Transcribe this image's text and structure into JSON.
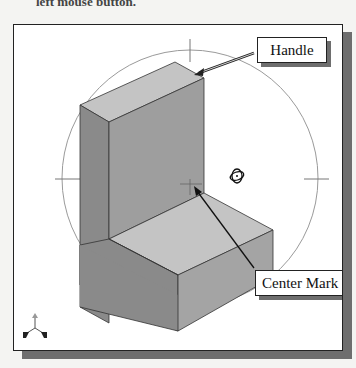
{
  "page": {
    "top_partial_text": "left mouse button.",
    "ghost_lines": [
      "by the triad, ... rotated with the ...",
      "...from the screen ... to ... with the",
      "...completely ... to any ... the",
      "option.",
      "...Rotate ... with the ...",
      "...Center ... to ... the ...",
      "...the ... the",
      "4.  Hit the function key [F6] once",
      "    automatically adjusted; display",
      "    and also to fit the display to the",
      "    ...adjusted view."
    ]
  },
  "figure": {
    "type": "3D free-orbit rotation viewport",
    "callouts": {
      "handle": "Handle",
      "center_mark": "Center Mark"
    },
    "colors": {
      "viewport_bg": "#ffffff",
      "border": "#222222",
      "shadow": "#6e6e6e",
      "face_top": "#c4c4c4",
      "face_left": "#8e8e8e",
      "face_right": "#a6a6a6",
      "orbit_circle": "#9a9a9a"
    },
    "icons": {
      "rotation_cursor": "orbit-cursor-icon",
      "triad": "xyz-triad-icon"
    }
  }
}
